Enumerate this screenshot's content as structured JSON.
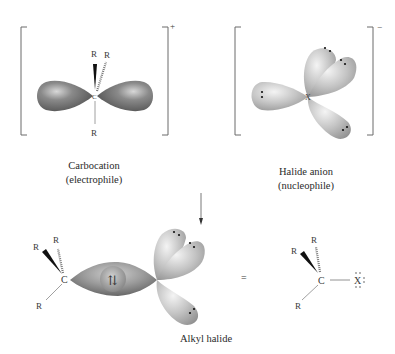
{
  "diagram": {
    "carbocation": {
      "charge": "+",
      "center_atom": "C",
      "substituents": [
        "R",
        "R",
        "R"
      ],
      "caption_line1": "Carbocation",
      "caption_line2": "(electrophile)"
    },
    "halide": {
      "charge": "−",
      "center_atom": "X",
      "caption_line1": "Halide anion",
      "caption_line2": "(nucleophile)"
    },
    "reaction_arrow": "down",
    "product": {
      "caption": "Alkyl halide",
      "center_atom": "C",
      "halogen_atom": "X",
      "substituents": [
        "R",
        "R",
        "R"
      ],
      "bond_electrons": "⇅",
      "equals": "=",
      "lewis_structure": {
        "carbon": "C",
        "halogen": "X",
        "substituents": [
          "R",
          "R",
          "R"
        ]
      }
    },
    "colors": {
      "carbocation_lobe": "#6e6e6e",
      "halide_lobe": "#b5b5b5",
      "bracket": "#6a6a6a",
      "text": "#3a3a3a"
    }
  }
}
